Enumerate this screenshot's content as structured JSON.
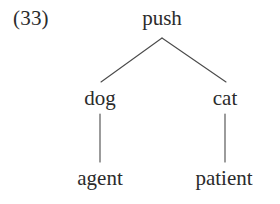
{
  "example": {
    "number_label": "(33)"
  },
  "tree": {
    "root": {
      "label": "push"
    },
    "children": [
      {
        "label": "dog",
        "child": {
          "label": "agent"
        }
      },
      {
        "label": "cat",
        "child": {
          "label": "patient"
        }
      }
    ]
  },
  "nodes": {
    "root": "push",
    "left_arg": "dog",
    "right_arg": "cat",
    "left_role": "agent",
    "right_role": "patient"
  },
  "style": {
    "background": "#ffffff",
    "text_color": "#2b2b2b",
    "edge_color": "#4a4a4a"
  }
}
